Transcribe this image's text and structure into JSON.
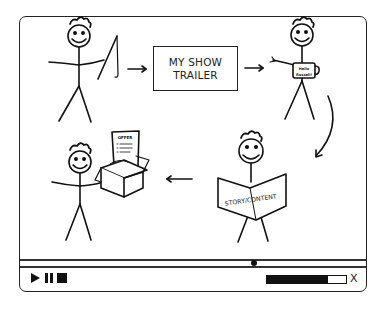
{
  "player": {
    "title_box": {
      "line1": "MY SHOW",
      "line2": "TRAILER"
    },
    "scenes": {
      "fisherman": {
        "description": "stick figure holding fishing rod"
      },
      "mug_figure": {
        "mug_text_line1": "Hello",
        "mug_text_line2": "Russell!"
      },
      "reader": {
        "book_text": "STORY/CONTENT"
      },
      "box_figure": {
        "paper_title": "OFFER"
      }
    },
    "timeline": {
      "scrubber_position_pct": 67
    },
    "controls": {
      "play_icon": "play-icon",
      "pause_icon": "pause-icon",
      "stop_icon": "stop-icon",
      "volume_pct": 77,
      "close_label": "X"
    },
    "colors": {
      "ink": "#111111",
      "background": "#ffffff",
      "frame": "#222222"
    }
  }
}
